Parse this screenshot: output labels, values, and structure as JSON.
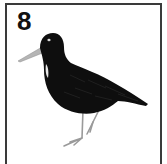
{
  "card": {
    "number": "8",
    "border_color": "#3a3a3a",
    "background": "#ffffff"
  },
  "illustration": {
    "subject": "black wading bird (oystercatcher-like) standing in profile facing left",
    "body_color": "#0d0d0d",
    "bill_color": "#b8b8b8",
    "leg_color": "#9a9a9a",
    "highlight_color": "#e8e8e8"
  }
}
